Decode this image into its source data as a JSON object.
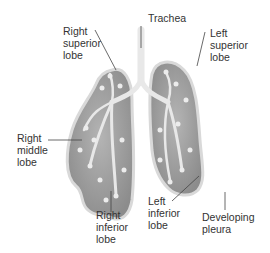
{
  "diagram": {
    "labels": {
      "right_superior_lobe": "Right\nsuperior\nlobe",
      "trachea": "Trachea",
      "left_superior_lobe": "Left\nsuperior\nlobe",
      "right_middle_lobe": "Right\nmiddle\nlobe",
      "right_inferior_lobe": "Right\ninferior\nlobe",
      "left_inferior_lobe": "Left\ninferior\nlobe",
      "developing_pleura": "Developing\npleura"
    },
    "colors": {
      "lung_fill": "#9a9a9a",
      "lung_outline": "#cfcfcf",
      "airway": "#e6e6e6",
      "text": "#333333",
      "leader_line": "#444444"
    }
  }
}
